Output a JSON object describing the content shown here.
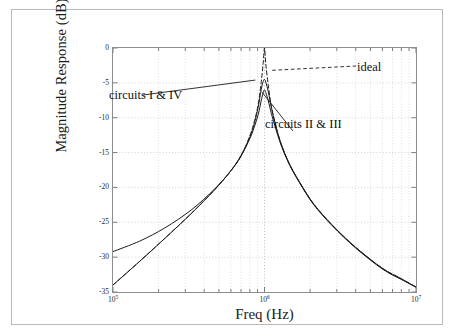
{
  "figure": {
    "axis_labels": {
      "x": "Freq (Hz)",
      "y": "Magnitude Response (dB)"
    },
    "annotations": {
      "circuits_1_4": "circuits I & IV",
      "circuits_2_3": "circuits II & III",
      "ideal": "ideal"
    }
  },
  "chart_data": {
    "type": "line",
    "title": "",
    "xlabel": "Freq (Hz)",
    "ylabel": "Magnitude Response (dB)",
    "xscale": "log",
    "xlim": [
      100000,
      10000000
    ],
    "ylim": [
      -35,
      0
    ],
    "grid": true,
    "grid_style": "dotted",
    "legend": "annotations-inline",
    "xticks": [
      100000,
      1000000,
      10000000
    ],
    "xtick_labels": [
      "10⁵",
      "10⁶",
      "10⁷"
    ],
    "xtick_label_parts": [
      {
        "base": "10",
        "exp": "5"
      },
      {
        "base": "10",
        "exp": "6"
      },
      {
        "base": "10",
        "exp": "7"
      }
    ],
    "yticks": [
      0,
      -5,
      -10,
      -15,
      -20,
      -25,
      -30,
      -35
    ],
    "ytick_labels": [
      "0",
      "-5",
      "-10",
      "-15",
      "-20",
      "-25",
      "-30",
      "-35"
    ],
    "series": [
      {
        "name": "ideal",
        "style": "dashed",
        "color": "#1a1a1a",
        "peak_db": 0,
        "peak_freq_hz": 1000000,
        "x": [
          100000,
          150000,
          220000,
          330000,
          470000,
          600000,
          700000,
          800000,
          860000,
          910000,
          950000,
          980000,
          1000000,
          1020000,
          1060000,
          1110000,
          1180000,
          1280000,
          1450000,
          1700000,
          2100000,
          2800000,
          4000000,
          6000000,
          8000000,
          10000000
        ],
        "y": [
          -34.0,
          -30.6,
          -27.3,
          -23.7,
          -20.3,
          -17.6,
          -15.5,
          -12.6,
          -10.4,
          -8.0,
          -5.0,
          -2.2,
          0.0,
          -2.3,
          -5.4,
          -8.4,
          -11.0,
          -13.6,
          -16.5,
          -19.2,
          -22.3,
          -25.4,
          -28.6,
          -31.6,
          -33.1,
          -34.3
        ]
      },
      {
        "name": "circuits II & III",
        "style": "solid",
        "color": "#1a1a1a",
        "peak_db": -6.0,
        "peak_freq_hz": 1000000,
        "x": [
          100000,
          150000,
          220000,
          330000,
          470000,
          600000,
          700000,
          800000,
          860000,
          910000,
          950000,
          980000,
          1000000,
          1020000,
          1060000,
          1110000,
          1180000,
          1280000,
          1450000,
          1700000,
          2100000,
          2800000,
          4000000,
          6000000,
          8000000,
          10000000
        ],
        "y": [
          -34.0,
          -30.6,
          -27.3,
          -23.7,
          -20.3,
          -17.6,
          -15.5,
          -13.0,
          -11.2,
          -9.5,
          -7.6,
          -6.4,
          -6.0,
          -6.4,
          -7.6,
          -9.4,
          -11.4,
          -13.8,
          -16.6,
          -19.3,
          -22.4,
          -25.5,
          -28.7,
          -31.7,
          -33.2,
          -34.3
        ]
      },
      {
        "name": "circuits I & IV",
        "style": "solid",
        "color": "#1a1a1a",
        "peak_db": -4.5,
        "peak_freq_hz": 1000000,
        "x": [
          100000,
          150000,
          220000,
          330000,
          470000,
          600000,
          700000,
          800000,
          860000,
          910000,
          950000,
          980000,
          1000000,
          1020000,
          1060000,
          1110000,
          1180000,
          1280000,
          1450000,
          1700000,
          2100000,
          2800000,
          4000000,
          6000000,
          8000000,
          10000000
        ],
        "y": [
          -29.2,
          -27.7,
          -25.8,
          -23.2,
          -20.2,
          -17.6,
          -15.4,
          -12.8,
          -10.7,
          -8.4,
          -6.0,
          -4.8,
          -4.5,
          -4.9,
          -6.3,
          -8.5,
          -10.9,
          -13.6,
          -16.5,
          -19.2,
          -22.3,
          -25.4,
          -28.6,
          -31.6,
          -33.1,
          -34.3
        ]
      }
    ],
    "annotations": [
      {
        "text": "circuits I & IV",
        "points_to_freq_hz": 870000,
        "points_to_db": -4.6
      },
      {
        "text": "circuits II & III",
        "points_to_freq_hz": 960000,
        "points_to_db": -6.3
      },
      {
        "text": "ideal",
        "points_to_freq_hz": 1120000,
        "points_to_db": -3.1
      }
    ]
  }
}
